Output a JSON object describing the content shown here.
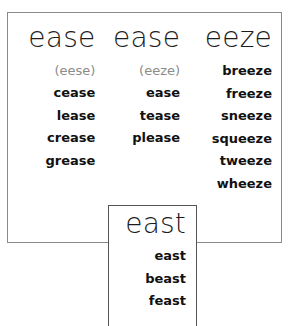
{
  "chart_data": {
    "type": "table",
    "columns": [
      {
        "header": "ease",
        "pronunciation": "(eese)",
        "words": [
          "cease",
          "lease",
          "crease",
          "grease"
        ]
      },
      {
        "header": "ease",
        "pronunciation": "(eeze)",
        "words": [
          "ease",
          "tease",
          "please"
        ]
      },
      {
        "header": "eeze",
        "pronunciation": "",
        "words": [
          "breeze",
          "freeze",
          "sneeze",
          "squeeze",
          "tweeze",
          "wheeze"
        ]
      }
    ],
    "inset": {
      "header": "east",
      "words": [
        "east",
        "beast",
        "feast"
      ]
    }
  },
  "main_box": {
    "columns": [
      {
        "header": "ease",
        "pronunciation": "(eese)",
        "words": [
          "cease",
          "lease",
          "crease",
          "grease"
        ]
      },
      {
        "header": "ease",
        "pronunciation": "(eeze)",
        "words": [
          "ease",
          "tease",
          "please"
        ]
      },
      {
        "header": "eeze",
        "words": [
          "breeze",
          "freeze",
          "sneeze",
          "squeeze",
          "tweeze",
          "wheeze"
        ]
      }
    ]
  },
  "east_box": {
    "header": "east",
    "words": [
      "east",
      "beast",
      "feast"
    ]
  },
  "colors": {
    "text": "#111111",
    "pronunciation": "#8b8b8b",
    "border_outer": "#8a8a8a",
    "border_inset": "#555555",
    "background": "#ffffff"
  }
}
